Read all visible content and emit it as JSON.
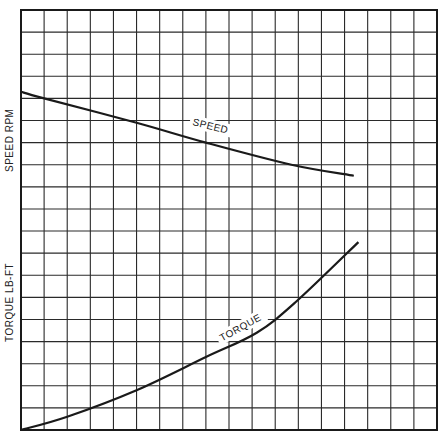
{
  "chart_data": {
    "type": "line",
    "title": "",
    "xlabel": "",
    "ylabels": [
      "SPEED RPM",
      "TORQUE LB-FT"
    ],
    "grid": true,
    "grid_columns": 18,
    "grid_rows": 19,
    "xlim": [
      0,
      18
    ],
    "ylim": [
      0,
      19
    ],
    "axis_ticks_labeled": false,
    "legend": "none (curves labeled inline)",
    "series": [
      {
        "name": "SPEED",
        "x": [
          0,
          1,
          5,
          8,
          11.7,
          14.4
        ],
        "y": [
          15.3,
          15.0,
          13.9,
          13.0,
          12.0,
          11.5
        ]
      },
      {
        "name": "TORQUE",
        "x": [
          0,
          2,
          5,
          8,
          10.2,
          11.9,
          14.6
        ],
        "y": [
          0,
          0.6,
          1.8,
          3.3,
          4.4,
          5.8,
          8.5
        ]
      }
    ],
    "annotations": [
      {
        "text": "SPEED",
        "x": 7.4,
        "y": 13.8
      },
      {
        "text": "TORQUE",
        "x": 8.7,
        "y": 4.0
      }
    ]
  },
  "labels": {
    "speed_axis": "SPEED RPM",
    "torque_axis": "TORQUE LB-FT",
    "speed_curve": "SPEED",
    "torque_curve": "TORQUE"
  },
  "colors": {
    "ink": "#1a1a1a",
    "grid": "#2a2a2a",
    "paper": "#ffffff"
  }
}
